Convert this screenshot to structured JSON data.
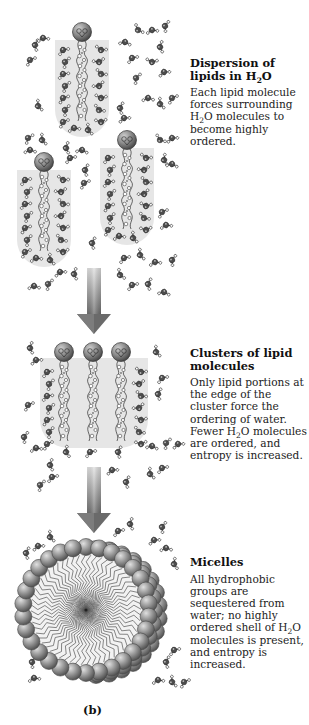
{
  "figure": {
    "panel_label": "(b)",
    "colors": {
      "shell": "#e6e6e6",
      "head_fill": "#8a8a8a",
      "oxygen": "#5a5a5a",
      "arrow_top": "#dcdcdc",
      "arrow_bottom": "#6e6e6e",
      "micelle_bead": "#9a9a9a",
      "micelle_core": "#f2f2f2",
      "tail_line": "#555555"
    },
    "icons": {
      "lipid": "lipid-molecule-icon",
      "water": "water-molecule-icon",
      "arrow": "down-arrow-icon",
      "micelle": "micelle-icon"
    }
  },
  "stages": [
    {
      "id": "dispersion",
      "title_pre": "Dispersion of lipids in H",
      "title_sub": "2",
      "title_post": "O",
      "body_pre": "Each lipid molecule forces surrounding H",
      "body_sub": "2",
      "body_post": "O molecules to become highly ordered."
    },
    {
      "id": "clusters",
      "title_pre": "Clusters of lipid molecules",
      "title_sub": "",
      "title_post": "",
      "body_pre": "Only lipid portions at the edge of the cluster force the ordering of water. Fewer H",
      "body_sub": "2",
      "body_post": "O molecules are ordered, and entropy is increased."
    },
    {
      "id": "micelles",
      "title_pre": "Micelles",
      "title_sub": "",
      "title_post": "",
      "body_pre": "All hydrophobic groups are sequestered from water;  no highly ordered shell of H",
      "body_sub": "2",
      "body_post": "O molecules is present, and entropy is increased."
    }
  ]
}
